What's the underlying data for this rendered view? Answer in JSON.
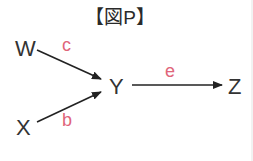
{
  "diagram": {
    "title": "【図P】",
    "colors": {
      "node_text": "#333333",
      "edge": "#222222",
      "edge_label": "#e0657a"
    },
    "nodes": [
      {
        "id": "W",
        "label": "W"
      },
      {
        "id": "X",
        "label": "X"
      },
      {
        "id": "Y",
        "label": "Y"
      },
      {
        "id": "Z",
        "label": "Z"
      }
    ],
    "edges": [
      {
        "from": "W",
        "to": "Y",
        "label": "c"
      },
      {
        "from": "X",
        "to": "Y",
        "label": "b"
      },
      {
        "from": "Y",
        "to": "Z",
        "label": "e"
      }
    ]
  }
}
